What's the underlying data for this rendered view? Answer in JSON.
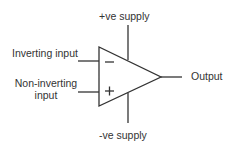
{
  "diagram": {
    "labels": {
      "positive_supply": "+ve supply",
      "negative_supply": "-ve supply",
      "inverting_input": "Inverting input",
      "non_inverting_input_line1": "Non-inverting",
      "non_inverting_input_line2": "input",
      "output": "Output"
    },
    "symbols": {
      "inverting": "−",
      "non_inverting": "+"
    },
    "colors": {
      "stroke": "#333333",
      "text": "#333333",
      "background": "#ffffff"
    }
  }
}
